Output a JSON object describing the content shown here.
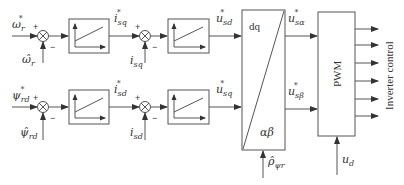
{
  "diagram": {
    "type": "block-diagram",
    "title": "",
    "top_row": {
      "ref_input": {
        "base": "ω",
        "sub": "r",
        "sup": "*"
      },
      "feedback": {
        "base": "ω̂",
        "sub": "r"
      },
      "summer1_signs": {
        "plus": "+",
        "minus": "−"
      },
      "block1_output": {
        "base": "i",
        "sub": "sq",
        "sup": "*"
      },
      "summer2_feedback": {
        "base": "i",
        "sub": "sq"
      },
      "summer2_signs": {
        "plus": "+",
        "minus": "−"
      },
      "block2_output": {
        "base": "u",
        "sub": "sd",
        "sup": "*"
      }
    },
    "bottom_row": {
      "ref_input": {
        "base": "ψ",
        "sub": "rd",
        "sup": "*"
      },
      "feedback": {
        "base": "ψ̂",
        "sub": "rd"
      },
      "summer1_signs": {
        "plus": "+",
        "minus": "−"
      },
      "block1_output": {
        "base": "i",
        "sub": "sd",
        "sup": "*"
      },
      "summer2_feedback": {
        "base": "i",
        "sub": "sd"
      },
      "summer2_signs": {
        "plus": "+",
        "minus": "−"
      },
      "block2_output": {
        "base": "u",
        "sub": "sq",
        "sup": "*"
      }
    },
    "transform_block": {
      "top_label": "dq",
      "bottom_label": "αβ",
      "angle_input": {
        "base": "ρ̂",
        "sub": "ψr"
      },
      "output_alpha": {
        "base": "u",
        "sub": "sα",
        "sup": "*"
      },
      "output_beta": {
        "base": "u",
        "sub": "sβ",
        "sup": "*"
      }
    },
    "pwm_block": {
      "label": "PWM",
      "dc_input": {
        "base": "u",
        "sub": "d"
      },
      "output_count": 6,
      "output_label": "Inverter control"
    },
    "controller_blocks": 4
  }
}
